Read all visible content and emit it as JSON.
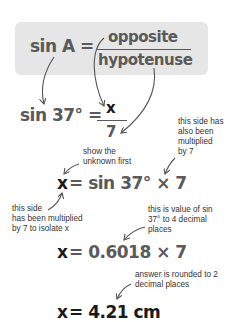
{
  "formula": {
    "lhs": "sin A =",
    "numerator": "opposite",
    "denominator": "hypotenuse",
    "box_color": "#e6e6e6"
  },
  "step1": {
    "lhs": "sin 37° =",
    "numerator": "x",
    "denominator": "7"
  },
  "step2": {
    "unknown": "x",
    "rhs": "= sin 37° × 7"
  },
  "step3": {
    "unknown": "x",
    "rhs": "= 0.6018 × 7"
  },
  "step4": {
    "unknown": "x",
    "rhs": "= 4.21 cm"
  },
  "annotations": {
    "show_unknown": "show the\nunknown first",
    "also_multiplied": "this side has\nalso been\nmultiplied\nby 7",
    "isolate_x": "this side\nhas been multiplied\nby 7 to isolate x",
    "sin_value": "this is value of sin\n37° to 4 decimal\nplaces",
    "rounded": "answer is rounded to 2\ndecimal places"
  },
  "colors": {
    "text_gray": "#5a5a5a",
    "unknown_black": "#1a1a1a",
    "arrow": "#555555"
  }
}
